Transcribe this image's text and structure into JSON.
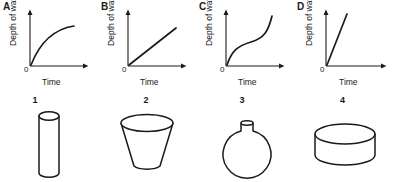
{
  "figure": {
    "background_color": "#ffffff",
    "stroke_color": "#1a1a1a",
    "axis_color": "#1a1a1a"
  },
  "graphs": [
    {
      "letter": "A",
      "y_axis_label": "Depth of water",
      "x_axis_label": "Time",
      "origin_label": "0",
      "curve_shape": "concave-down-increasing"
    },
    {
      "letter": "B",
      "y_axis_label": "Depth of water",
      "x_axis_label": "Time",
      "origin_label": "0",
      "curve_shape": "linear-moderate-slope"
    },
    {
      "letter": "C",
      "y_axis_label": "Depth of water",
      "x_axis_label": "Time",
      "origin_label": "0",
      "curve_shape": "s-curve-steep-flat-steep"
    },
    {
      "letter": "D",
      "y_axis_label": "Depth of water",
      "x_axis_label": "Time",
      "origin_label": "0",
      "curve_shape": "linear-steep-slope"
    }
  ],
  "vessels": [
    {
      "number": "1",
      "shape_name": "tall-narrow-cylinder"
    },
    {
      "number": "2",
      "shape_name": "truncated-cone-wide-top"
    },
    {
      "number": "3",
      "shape_name": "round-flask-narrow-neck"
    },
    {
      "number": "4",
      "shape_name": "wide-flat-cylinder"
    }
  ]
}
